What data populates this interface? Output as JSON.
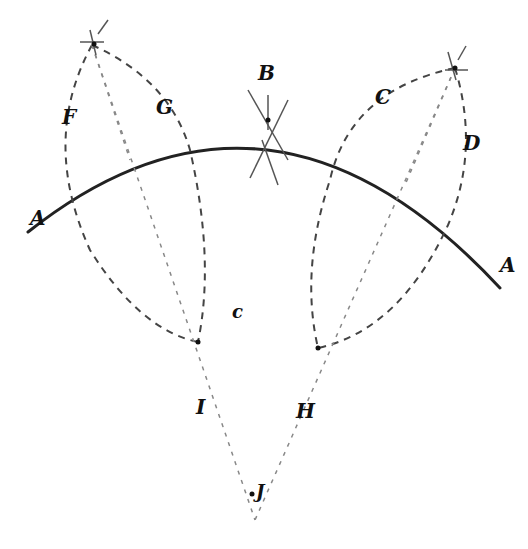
{
  "diagram": {
    "labels": {
      "A_left": "A",
      "A_right": "A",
      "B": "B",
      "C": "C",
      "D": "D",
      "F": "F",
      "G": "G",
      "H": "H",
      "I": "I",
      "J": "J",
      "c": "c"
    },
    "colors": {
      "background": "#ffffff",
      "ink": "#222222",
      "construction": "#888888"
    }
  }
}
